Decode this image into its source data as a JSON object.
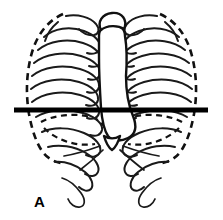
{
  "figure": {
    "panel_label": "A",
    "view": "anterior",
    "background_color": "#ffffff",
    "line_color": "#111111",
    "section_line_color": "#000000",
    "label_position": {
      "x": 34,
      "y": 194
    },
    "canvas": {
      "width": 223,
      "height": 220
    }
  },
  "anatomy": {
    "structures": [
      {
        "name": "rib-cage-left",
        "style": "solid-outline"
      },
      {
        "name": "rib-cage-right",
        "style": "solid-outline"
      },
      {
        "name": "sternum",
        "style": "solid-outline"
      },
      {
        "name": "mediastinum-cardiac-silhouette",
        "style": "solid-outline"
      },
      {
        "name": "pleural-lung-border",
        "style": "dashed-outline"
      },
      {
        "name": "diaphragm-dome",
        "style": "dashed-outline"
      },
      {
        "name": "transverse-section-line",
        "style": "thick-solid"
      }
    ],
    "rib_pairs_visible": 10,
    "floating_rib_pairs": 2
  }
}
